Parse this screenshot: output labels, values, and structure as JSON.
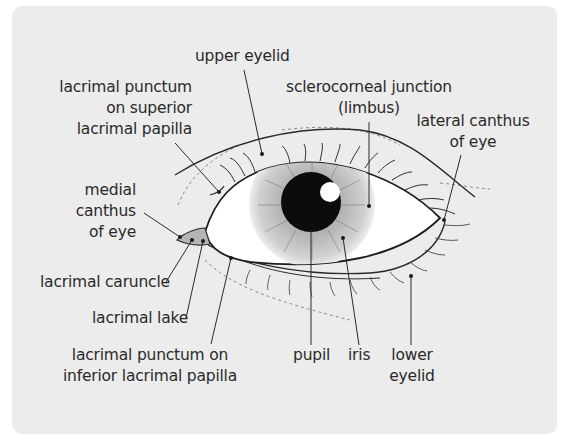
{
  "diagram": {
    "background_color": "#ececec",
    "labels": {
      "upper_eyelid": "upper eyelid",
      "lacrimal_punctum_superior": [
        "lacrimal punctum",
        "on superior",
        "lacrimal papilla"
      ],
      "sclerocorneal_junction": [
        "sclerocorneal junction",
        "(limbus)"
      ],
      "lateral_canthus": [
        "lateral canthus",
        "of eye"
      ],
      "medial_canthus": [
        "medial",
        "canthus",
        "of eye"
      ],
      "lacrimal_caruncle": "lacrimal caruncle",
      "lacrimal_lake": "lacrimal lake",
      "lacrimal_punctum_inferior": [
        "lacrimal punctum on",
        "inferior lacrimal papilla"
      ],
      "pupil": "pupil",
      "iris": "iris",
      "lower_eyelid": [
        "lower",
        "eyelid"
      ]
    }
  }
}
